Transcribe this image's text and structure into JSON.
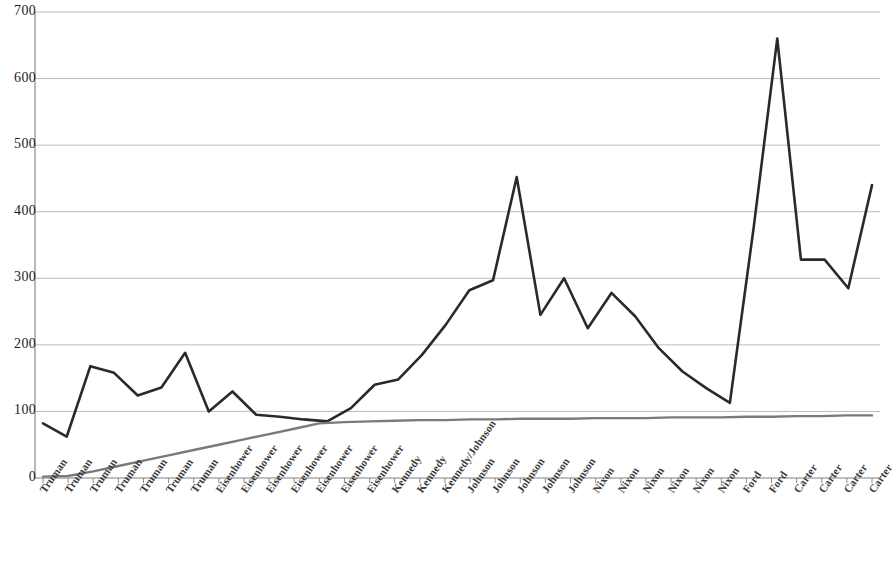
{
  "chart_data": {
    "type": "line",
    "title": "",
    "subtitle": "",
    "xlabel": "",
    "ylabel": "",
    "ylim": [
      0,
      700
    ],
    "ytick_step": 100,
    "yticks": [
      0,
      100,
      200,
      300,
      400,
      500,
      600,
      700
    ],
    "grid": true,
    "grid_axis": "y",
    "legend": false,
    "legend_position": "none",
    "categories": [
      "Truman",
      "Truman",
      "Truman",
      "Truman",
      "Truman",
      "Truman",
      "Truman",
      "Eisenhower",
      "Eisenhower",
      "Eisenhower",
      "Eisenhower",
      "Eisenhower",
      "Eisenhower",
      "Eisenhower",
      "Kennedy",
      "Kennedy",
      "Kennedy/Johnson",
      "Johnson",
      "Johnson",
      "Johnson",
      "Johnson",
      "Johnson",
      "Nixon",
      "Nixon",
      "Nixon",
      "Nixon",
      "Nixon",
      "Nixon",
      "Ford",
      "Ford",
      "Carter",
      "Carter",
      "Carter",
      "Carter"
    ],
    "series": [
      {
        "name": "series-1",
        "color": "#2a2a2a",
        "width": 2.6,
        "values": [
          82,
          62,
          168,
          158,
          124,
          136,
          188,
          100,
          130,
          95,
          92,
          88,
          85,
          105,
          140,
          148,
          185,
          230,
          282,
          297,
          452,
          245,
          300,
          225,
          278,
          243,
          195,
          160,
          135,
          113,
          375,
          660,
          328,
          328
        ]
      },
      {
        "name": "series-2",
        "color": "#7a7a7a",
        "width": 2.4,
        "values": [
          2,
          3,
          10,
          18,
          26,
          34,
          42,
          50,
          58,
          66,
          74,
          82,
          84,
          85,
          86,
          87,
          87,
          88,
          88,
          89,
          89,
          89,
          90,
          90,
          90,
          91,
          91,
          91,
          92,
          92,
          93,
          93,
          94,
          94
        ]
      }
    ],
    "extra_points_series1": [
      285,
      440
    ]
  },
  "axis": {
    "y_labels": [
      "700",
      "600",
      "500",
      "400",
      "300",
      "200",
      "100",
      "0"
    ]
  },
  "colors": {
    "background": "#ffffff",
    "grid": "#b4b4b4",
    "axis": "#808080",
    "series1": "#2a2a2a",
    "series2": "#7a7a7a",
    "tick_text": "#1c1c1c",
    "xlabel_text": "#3a3a3a"
  }
}
